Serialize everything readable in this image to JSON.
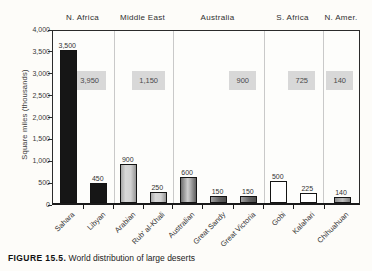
{
  "caption": {
    "label": "FIGURE 15.5.",
    "text": "World distribution of large deserts"
  },
  "colors": {
    "bar_black": "#161616",
    "bar_light_gray": "#cfcfcf",
    "bar_medium_gray": "#9a9a9a",
    "bar_dark_gray": "#5f5f5f",
    "bar_white": "#ffffff",
    "bar_gray": "#9e9e9e",
    "total_box_bg": "#d8d8d8",
    "group_divider": "#c9c9c9",
    "plot_border": "#2b2b2b"
  },
  "chart_data": {
    "type": "bar",
    "title": "",
    "xlabel": "",
    "ylabel": "Square miles (thousands)",
    "ylim": [
      0,
      4000
    ],
    "ytick_interval": 500,
    "ytick_labels": [
      "0",
      "500",
      "1,000",
      "1,500",
      "2,000",
      "2,500",
      "3,000",
      "3,500",
      "4,000"
    ],
    "grid": false,
    "legend": "none",
    "groups": [
      {
        "label": "N. Africa",
        "total": 3950,
        "total_label": "3,950",
        "deserts": [
          {
            "name": "Sahara",
            "value": 3500,
            "value_label": "3,500",
            "fill": "black"
          },
          {
            "name": "Libyan",
            "value": 450,
            "value_label": "450",
            "fill": "black"
          }
        ]
      },
      {
        "label": "Middle East",
        "total": 1150,
        "total_label": "1,150",
        "deserts": [
          {
            "name": "Arabian",
            "value": 900,
            "value_label": "900",
            "fill": "light"
          },
          {
            "name": "Rub' al-Khali",
            "value": 250,
            "value_label": "250",
            "fill": "light"
          }
        ]
      },
      {
        "label": "Australia",
        "total": 900,
        "total_label": "900",
        "deserts": [
          {
            "name": "Australian",
            "value": 600,
            "value_label": "600",
            "fill": "medium"
          },
          {
            "name": "Great Sandy",
            "value": 150,
            "value_label": "150",
            "fill": "dark"
          },
          {
            "name": "Great Victoria",
            "value": 150,
            "value_label": "150",
            "fill": "dark"
          }
        ]
      },
      {
        "label": "S. Africa",
        "total": 725,
        "total_label": "725",
        "deserts": [
          {
            "name": "Gobi",
            "value": 500,
            "value_label": "500",
            "fill": "white"
          },
          {
            "name": "Kalahari",
            "value": 225,
            "value_label": "225",
            "fill": "white"
          }
        ]
      },
      {
        "label": "N. Amer.",
        "total": 140,
        "total_label": "140",
        "deserts": [
          {
            "name": "Chihuahuan",
            "value": 140,
            "value_label": "140",
            "fill": "gray"
          }
        ]
      }
    ]
  }
}
